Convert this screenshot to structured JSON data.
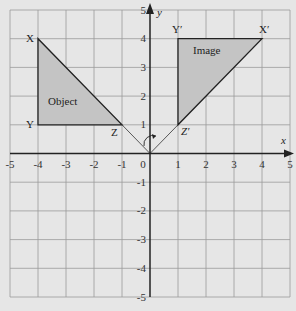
{
  "axes": {
    "x_label": "x",
    "y_label": "y",
    "x_ticks": [
      "-5",
      "-4",
      "-3",
      "-2",
      "-1",
      "0",
      "1",
      "2",
      "3",
      "4",
      "5"
    ],
    "y_ticks": [
      "5",
      "4",
      "3",
      "2",
      "1",
      "-1",
      "-2",
      "-3",
      "-4",
      "-5"
    ],
    "range": {
      "xmin": -5,
      "xmax": 5,
      "ymin": -5,
      "ymax": 5
    }
  },
  "object": {
    "label": "Object",
    "vertices": [
      {
        "name": "X",
        "x": -4,
        "y": 4
      },
      {
        "name": "Y",
        "x": -4,
        "y": 1
      },
      {
        "name": "Z",
        "x": -1,
        "y": 1
      }
    ]
  },
  "image": {
    "label": "Image",
    "vertices": [
      {
        "name": "Y′",
        "x": 1,
        "y": 4
      },
      {
        "name": "X′",
        "x": 4,
        "y": 4
      },
      {
        "name": "Z′",
        "x": 1,
        "y": 1
      }
    ]
  },
  "labels": {
    "X": "X",
    "Y": "Y",
    "Z": "Z",
    "Xp": "X′",
    "Yp": "Y′",
    "Zp": "Z′",
    "origin": "0"
  },
  "colors": {
    "background": "#e6e6e6",
    "grid": "#9a9a9a",
    "shape_fill": "#c4c4c4",
    "line": "#222222"
  }
}
